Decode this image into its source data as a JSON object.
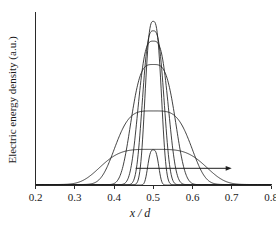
{
  "chart_data": {
    "type": "line",
    "title": "",
    "xlabel": "x / d",
    "ylabel": "Electric energy density (a.u.)",
    "xlim": [
      0.2,
      0.8
    ],
    "ylim": [
      0,
      1
    ],
    "grid": false,
    "legend": "none",
    "x_ticks": [
      "0.2",
      "0.3",
      "0.4",
      "0.5",
      "0.6",
      "0.7",
      "0.8"
    ],
    "x_tick_values": [
      0.2,
      0.3,
      0.4,
      0.5,
      0.6,
      0.7,
      0.8
    ],
    "y_ticks": [],
    "y_tick_values": [],
    "series": [
      {
        "name": "profile-1-broadest",
        "center": 0.5,
        "peak": 0.215,
        "halfwidth": 0.135,
        "shape_exponent": 2.0,
        "baseline": 0.006
      },
      {
        "name": "profile-2-broad",
        "center": 0.5,
        "peak": 0.45,
        "halfwidth": 0.098,
        "shape_exponent": 2.0,
        "baseline": 0.006
      },
      {
        "name": "profile-3-medium",
        "center": 0.5,
        "peak": 0.735,
        "halfwidth": 0.058,
        "shape_exponent": 1.75,
        "baseline": 0.005
      },
      {
        "name": "profile-4-narrow",
        "center": 0.5,
        "peak": 0.878,
        "halfwidth": 0.04,
        "shape_exponent": 1.6,
        "baseline": 0.005
      },
      {
        "name": "profile-5-narrower",
        "center": 0.5,
        "peak": 0.942,
        "halfwidth": 0.029,
        "shape_exponent": 1.5,
        "baseline": 0.004
      },
      {
        "name": "profile-6-narrowest",
        "center": 0.5,
        "peak": 1.0,
        "halfwidth": 0.022,
        "shape_exponent": 1.45,
        "baseline": 0.004
      },
      {
        "name": "profile-7-low-spike",
        "center": 0.5,
        "peak": 0.215,
        "halfwidth": 0.0145,
        "shape_exponent": 1.5,
        "baseline": 0.003
      }
    ],
    "annotations": [
      {
        "name": "trend-arrow",
        "type": "arrow",
        "direction": "right",
        "x_start": 0.455,
        "x_end": 0.7,
        "y": 0.105,
        "label": ""
      }
    ]
  }
}
